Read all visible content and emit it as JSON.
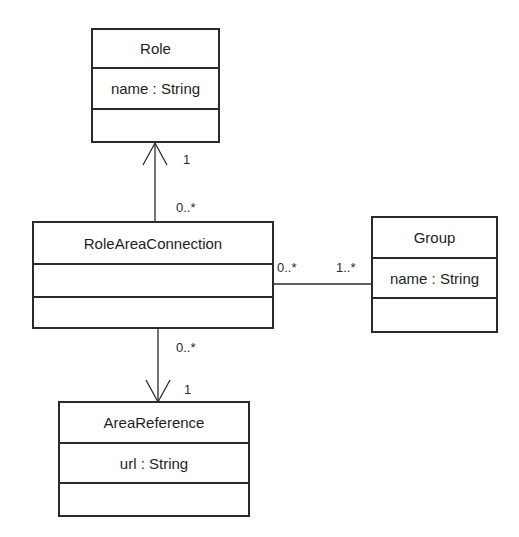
{
  "diagram": {
    "type": "uml-class-diagram",
    "classes": [
      {
        "id": "role",
        "name": "Role",
        "attributes": [
          "name : String"
        ],
        "operations": []
      },
      {
        "id": "role_area_connection",
        "name": "RoleAreaConnection",
        "attributes": [
          ""
        ],
        "operations": []
      },
      {
        "id": "group",
        "name": "Group",
        "attributes": [
          "name : String"
        ],
        "operations": []
      },
      {
        "id": "area_reference",
        "name": "AreaReference",
        "attributes": [
          "url : String"
        ],
        "operations": []
      }
    ],
    "associations": [
      {
        "from": "RoleAreaConnection",
        "to": "Role",
        "navigable_to": "Role",
        "from_multiplicity": "0..*",
        "to_multiplicity": "1"
      },
      {
        "from": "RoleAreaConnection",
        "to": "AreaReference",
        "navigable_to": "AreaReference",
        "from_multiplicity": "0..*",
        "to_multiplicity": "1"
      },
      {
        "from": "RoleAreaConnection",
        "to": "Group",
        "navigable_to": null,
        "from_multiplicity": "0..*",
        "to_multiplicity": "1..*"
      }
    ],
    "labels": {
      "role_end_mult": "1",
      "rac_role_end_mult": "0..*",
      "rac_area_end_mult": "0..*",
      "area_end_mult": "1",
      "rac_group_end_mult": "0..*",
      "group_end_mult": "1..*"
    }
  },
  "colors": {
    "line": "#2a2a2a",
    "background": "#ffffff",
    "text": "#1e1e1e"
  }
}
